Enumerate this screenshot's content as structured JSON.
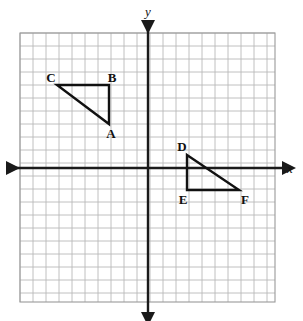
{
  "figure": {
    "kind": "coordinate-plane-diagram",
    "background_color": "#ffffff",
    "grid": {
      "line_color": "#b9b9b9",
      "border_color": "#9a9a9a",
      "cell_size_px": 13,
      "left_px": 20,
      "top_px": 33,
      "right_px": 275,
      "bottom_px": 302,
      "columns": 20,
      "rows": 21
    },
    "axes": {
      "color": "#1a1a1a",
      "stroke_width": 2.4,
      "origin_px": {
        "x": 148,
        "y": 168
      },
      "x_axis": {
        "label": "x",
        "label_px": {
          "x": 290,
          "y": 173
        },
        "start_px": {
          "x": 8,
          "y": 168
        },
        "end_px": {
          "x": 284,
          "y": 168
        },
        "arrow_left": true,
        "arrow_right": true
      },
      "y_axis": {
        "label": "y",
        "label_px": {
          "x": 148,
          "y": 16
        },
        "start_px": {
          "x": 148,
          "y": 22
        },
        "end_px": {
          "x": 148,
          "y": 314
        },
        "arrow_up": true,
        "arrow_down": true
      }
    },
    "shapes": [
      {
        "name": "triangle-abc",
        "type": "triangle",
        "stroke_color": "#111111",
        "stroke_width": 2.4,
        "fill": "none",
        "quadrant": "II",
        "vertices": [
          {
            "label": "A",
            "px": {
              "x": 109,
              "y": 124
            },
            "grid": {
              "x": -3,
              "y": 3
            },
            "label_px": {
              "x": 111,
              "y": 138
            },
            "label_anchor": "middle"
          },
          {
            "label": "B",
            "px": {
              "x": 109,
              "y": 85
            },
            "grid": {
              "x": -3,
              "y": 6
            },
            "label_px": {
              "x": 112,
              "y": 82
            },
            "label_anchor": "middle"
          },
          {
            "label": "C",
            "px": {
              "x": 57,
              "y": 85
            },
            "grid": {
              "x": -7,
              "y": 6
            },
            "label_px": {
              "x": 51,
              "y": 82
            },
            "label_anchor": "middle"
          }
        ]
      },
      {
        "name": "triangle-def",
        "type": "triangle",
        "stroke_color": "#111111",
        "stroke_width": 2.4,
        "fill": "none",
        "quadrant": "IV",
        "vertices": [
          {
            "label": "D",
            "px": {
              "x": 187,
              "y": 155
            },
            "grid": {
              "x": 3,
              "y": 1
            },
            "label_px": {
              "x": 182,
              "y": 151
            },
            "label_anchor": "middle"
          },
          {
            "label": "E",
            "px": {
              "x": 187,
              "y": 190
            },
            "grid": {
              "x": 3,
              "y": -2
            },
            "label_px": {
              "x": 183,
              "y": 204
            },
            "label_anchor": "middle"
          },
          {
            "label": "F",
            "px": {
              "x": 239,
              "y": 190
            },
            "grid": {
              "x": 7,
              "y": -2
            },
            "label_px": {
              "x": 245,
              "y": 204
            },
            "label_anchor": "middle"
          }
        ]
      }
    ]
  },
  "chart_data": {
    "type": "scatter",
    "title": "",
    "xlabel": "x",
    "ylabel": "y",
    "grid": true,
    "legend": "none",
    "xlim": [
      -10,
      10
    ],
    "ylim": [
      -10,
      10
    ],
    "series": [
      {
        "name": "Triangle ABC",
        "points": [
          {
            "label": "A",
            "x": -3,
            "y": 3
          },
          {
            "label": "B",
            "x": -3,
            "y": 6
          },
          {
            "label": "C",
            "x": -7,
            "y": 6
          }
        ]
      },
      {
        "name": "Triangle DEF",
        "points": [
          {
            "label": "D",
            "x": 3,
            "y": 1
          },
          {
            "label": "E",
            "x": 3,
            "y": -2
          },
          {
            "label": "F",
            "x": 7,
            "y": -2
          }
        ]
      }
    ]
  }
}
